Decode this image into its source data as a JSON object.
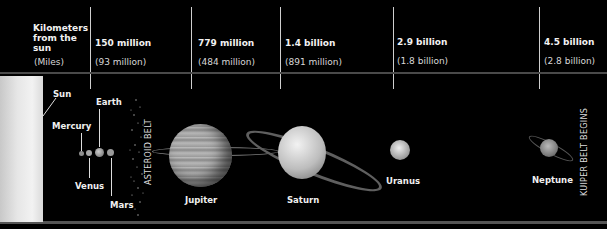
{
  "header": {
    "label_km": "Kilometers from the sun",
    "label_miles": "(Miles)",
    "columns": [
      {
        "km": "150 million",
        "miles": "(93 million)"
      },
      {
        "km": "779 million",
        "miles": "(484 million)"
      },
      {
        "km": "1.4 billion",
        "miles": "(891 million)"
      },
      {
        "km": "2.9 billion",
        "miles": "(1.8 billion)"
      },
      {
        "km": "4.5 billion",
        "miles": "(2.8 billion)"
      }
    ]
  },
  "bodies": {
    "sun": "Sun",
    "mercury": "Mercury",
    "venus": "Venus",
    "earth": "Earth",
    "mars": "Mars",
    "asteroid_belt": "ASTEROID BELT",
    "jupiter": "Jupiter",
    "saturn": "Saturn",
    "uranus": "Uranus",
    "neptune": "Neptune",
    "kuiper_belt": "KUIPER BELT BEGINS"
  },
  "colors": {
    "background": "#000000",
    "text": "#f0f0f0",
    "line": "#cfcfcf"
  }
}
